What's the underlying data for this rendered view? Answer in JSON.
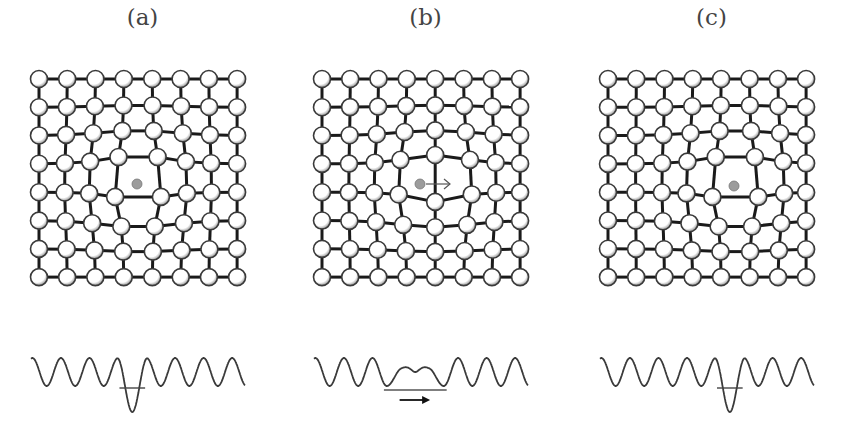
{
  "figure": {
    "colors": {
      "bond": "#1a1a1a",
      "atom_fill": "#ffffff",
      "atom_edge": "#3a3a3a",
      "atom_shade": "#9a9a9a",
      "interstitial": "#9c9c9c",
      "curve": "#3a3a3a",
      "arrow": "#555555"
    },
    "lattice": {
      "rows": 8,
      "cols": 8,
      "spacing": 28.3,
      "atom_radius": 8.5,
      "interstitial_radius": 5
    },
    "panels": [
      {
        "id": "a",
        "label": "(a)",
        "offset_x": 0,
        "lattice_origin": [
          39,
          79
        ],
        "state": "initial",
        "interstitial": {
          "x": 137,
          "y": 184,
          "site_col": 3.5
        },
        "arrow": null,
        "energy": {
          "x0": 31,
          "x1": 245,
          "baseline_y": 372,
          "amplitude": 14,
          "wells": 7,
          "deep_well_index": 3,
          "deep_well_depth": 26,
          "level_y": 392
        }
      },
      {
        "id": "b",
        "label": "(b)",
        "offset_x": 283,
        "lattice_origin": [
          39,
          79
        ],
        "state": "saddle",
        "interstitial": {
          "x": 420,
          "y": 184,
          "site_col": 4.0
        },
        "arrow": {
          "x1": 426,
          "y1": 184,
          "x2": 450,
          "y2": 184
        },
        "energy": {
          "x0": 31,
          "x1": 245,
          "baseline_y": 372,
          "amplitude": 14,
          "wells": 7,
          "deep_well_index": 3,
          "deep_well_depth": 18,
          "level_y": 392,
          "double_well": true
        }
      },
      {
        "id": "c",
        "label": "(c)",
        "offset_x": 569,
        "lattice_origin": [
          39,
          79
        ],
        "state": "final",
        "interstitial": {
          "x": 734,
          "y": 186,
          "site_col": 4.5
        },
        "arrow": null,
        "energy": {
          "x0": 31,
          "x1": 245,
          "baseline_y": 372,
          "amplitude": 14,
          "wells": 7,
          "deep_well_index": 4,
          "deep_well_depth": 26,
          "level_y": 392
        }
      }
    ]
  }
}
